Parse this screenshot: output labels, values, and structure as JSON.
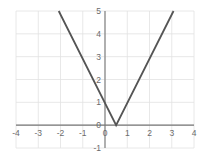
{
  "chart_data": {
    "type": "line",
    "title": "",
    "xlabel": "",
    "ylabel": "",
    "xlim": [
      -4,
      4
    ],
    "ylim": [
      -1,
      5
    ],
    "grid": true,
    "legend_position": "none",
    "xticks": [
      -4,
      -3,
      -2,
      -1,
      0,
      1,
      2,
      3,
      4
    ],
    "xtick_labels": [
      "-4",
      "-3",
      "-2",
      "-1",
      "0",
      "1",
      "2",
      "3",
      "4"
    ],
    "yticks": [
      -1,
      0,
      1,
      2,
      3,
      4,
      5
    ],
    "ytick_labels": [
      "-1",
      "0",
      "1",
      "2",
      "3",
      "4",
      "5"
    ],
    "series": [
      {
        "name": "absolute-value-v",
        "shape": "v",
        "vertex": [
          0.5,
          0
        ],
        "slope_left": -2.4,
        "slope_right": 2.4,
        "y_intercept": 1.2,
        "color": "#555555",
        "line_width": 1.8,
        "points": [
          [
            -2.08,
            5
          ],
          [
            0.5,
            0
          ],
          [
            3.08,
            5
          ]
        ]
      }
    ],
    "axis_color": "#777777",
    "grid_color": "#e2e2e2",
    "tick_label_color": "#6b6b6b",
    "background": "#ffffff"
  }
}
